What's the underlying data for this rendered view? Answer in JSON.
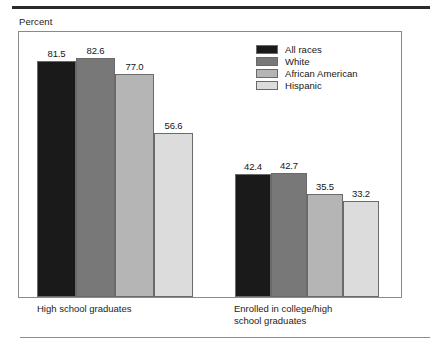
{
  "axis_title": "Percent",
  "legend": {
    "items": [
      {
        "label": "All races",
        "color": "#1a1a1a"
      },
      {
        "label": "White",
        "color": "#787878"
      },
      {
        "label": "African American",
        "color": "#b5b5b5"
      },
      {
        "label": "Hispanic",
        "color": "#dcdcdc"
      }
    ]
  },
  "groups": [
    {
      "caption": "High school graduates"
    },
    {
      "caption": "Enrolled in college/high\nschool graduates"
    }
  ],
  "chart_data": {
    "type": "bar",
    "title": "",
    "subtitle": "",
    "xlabel": "",
    "ylabel": "Percent",
    "ylim": [
      0,
      100
    ],
    "grid": false,
    "legend_position": "top-right",
    "categories": [
      "High school graduates",
      "Enrolled in college/high school graduates"
    ],
    "series": [
      {
        "name": "All races",
        "color": "#1a1a1a",
        "values": [
          81.5,
          42.4
        ]
      },
      {
        "name": "White",
        "color": "#787878",
        "values": [
          82.6,
          42.7
        ]
      },
      {
        "name": "African American",
        "color": "#b5b5b5",
        "values": [
          77.0,
          35.5
        ]
      },
      {
        "name": "Hispanic",
        "color": "#dcdcdc",
        "values": [
          56.6,
          33.2
        ]
      }
    ],
    "data_labels": [
      [
        "81.5",
        "82.6",
        "77.0",
        "56.6"
      ],
      [
        "42.4",
        "42.7",
        "35.5",
        "33.2"
      ]
    ]
  }
}
